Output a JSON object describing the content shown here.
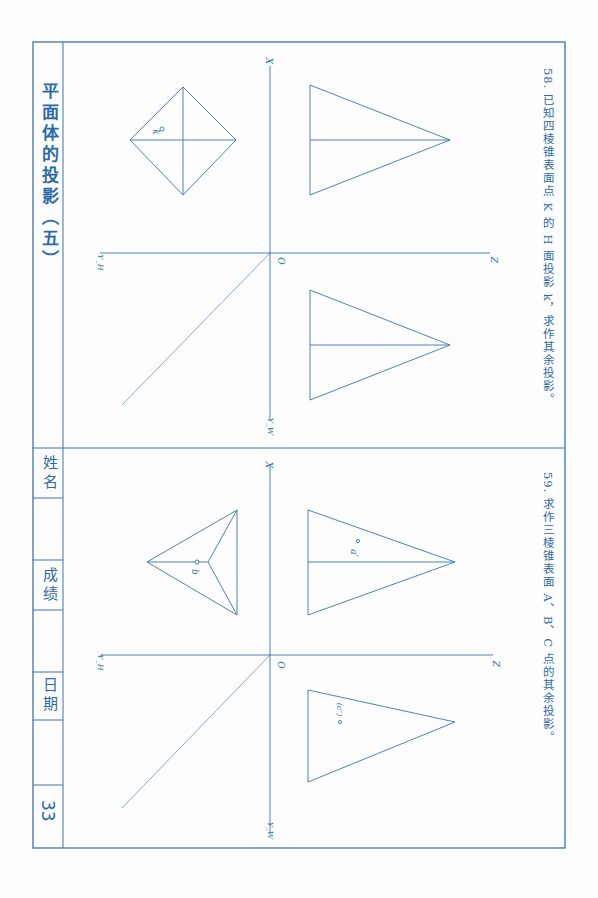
{
  "sheet": {
    "title": "平面体的投影（五）",
    "page_number": "33",
    "fields": [
      {
        "label": "姓名",
        "value": ""
      },
      {
        "label": "成绩",
        "value": ""
      },
      {
        "label": "日期",
        "value": ""
      }
    ],
    "line_color": "#2d6aa8"
  },
  "problems": [
    {
      "number": "58.",
      "prompt": "已知四棱锥表面点 K 的 H 面投影 k，求作其余投影。",
      "axis_labels": {
        "x": "X",
        "z": "Z",
        "o": "O",
        "yh": "Y_H",
        "yw": "Y_W"
      },
      "point_labels": [
        "k"
      ]
    },
    {
      "number": "59.",
      "prompt": "求作三棱锥表面 A、B、C 点的其余投影。",
      "axis_labels": {
        "x": "X",
        "z": "Z",
        "o": "O",
        "yh": "Y_H",
        "yw": "Y_W"
      },
      "point_labels": [
        "a′",
        "b",
        "(c″)"
      ]
    }
  ]
}
